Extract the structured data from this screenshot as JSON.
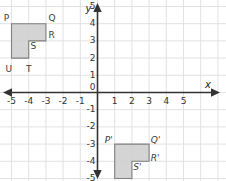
{
  "chart_data": {
    "type": "scatter",
    "title": "",
    "xlabel": "x",
    "ylabel": "y",
    "xlim": [
      -6,
      6
    ],
    "ylim": [
      -6,
      6
    ],
    "grid": true,
    "legend_position": "none",
    "x_ticks": [
      "-5",
      "-4",
      "-3",
      "-2",
      "-1",
      "0",
      "1",
      "2",
      "3",
      "4",
      "5"
    ],
    "x_tick_values": [
      -5,
      -4,
      -3,
      -2,
      -1,
      0,
      1,
      2,
      3,
      4,
      5
    ],
    "y_ticks": [
      "5",
      "4",
      "3",
      "2",
      "1",
      "0",
      "-1",
      "-2",
      "-3",
      "-4",
      "-5"
    ],
    "y_tick_values": [
      5,
      4,
      3,
      2,
      1,
      0,
      -1,
      -2,
      -3,
      -4,
      -5
    ],
    "shapes": [
      {
        "name": "preimage",
        "fill": "#cccccc",
        "stroke": "#808080",
        "vertices": [
          {
            "label": "P",
            "x": -5,
            "y": 4
          },
          {
            "label": "Q",
            "x": -3,
            "y": 4
          },
          {
            "label": "R",
            "x": -3,
            "y": 3
          },
          {
            "label": "S",
            "x": -4,
            "y": 3
          },
          {
            "label": "T",
            "x": -4,
            "y": 2
          },
          {
            "label": "U",
            "x": -5,
            "y": 2
          }
        ]
      },
      {
        "name": "image",
        "fill": "#cccccc",
        "stroke": "#808080",
        "vertices": [
          {
            "label": "P'",
            "x": 1,
            "y": -3
          },
          {
            "label": "Q'",
            "x": 3,
            "y": -3
          },
          {
            "label": "R'",
            "x": 3,
            "y": -4
          },
          {
            "label": "S'",
            "x": 2,
            "y": -4
          },
          {
            "label": "T'",
            "x": 2,
            "y": -5
          },
          {
            "label": "U'",
            "x": 1,
            "y": -5
          }
        ]
      }
    ]
  },
  "axes": {
    "x_axis_label": "x",
    "y_axis_label": "y",
    "origin_label": "0",
    "axis_color": "#333333",
    "grid_color": "#e2e2e6"
  },
  "vertex_labels": {
    "preimage": [
      {
        "text": "P",
        "x": -5.45,
        "y": 4.55
      },
      {
        "text": "Q",
        "x": -2.85,
        "y": 4.55
      },
      {
        "text": "R",
        "x": -2.85,
        "y": 3.55
      },
      {
        "text": "S",
        "x": -3.9,
        "y": 2.95
      },
      {
        "text": "T",
        "x": -4.15,
        "y": 1.62
      },
      {
        "text": "U",
        "x": -5.35,
        "y": 1.62
      }
    ],
    "image": [
      {
        "text": "P'",
        "x": 0.42,
        "y": -2.55
      },
      {
        "text": "Q'",
        "x": 3.1,
        "y": -2.55
      },
      {
        "text": "R'",
        "x": 3.1,
        "y": -3.55
      },
      {
        "text": "S'",
        "x": 2.08,
        "y": -4.1
      },
      {
        "text": "T'",
        "x": 1.82,
        "y": -5.45
      },
      {
        "text": "U'",
        "x": 0.72,
        "y": -5.45
      }
    ]
  }
}
